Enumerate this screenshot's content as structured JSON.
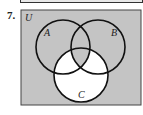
{
  "problem": {
    "number": "7."
  },
  "diagram": {
    "universe_label": "U",
    "sets": [
      {
        "label": "A",
        "cx": 63,
        "cy": 47,
        "r": 27
      },
      {
        "label": "B",
        "cx": 98,
        "cy": 47,
        "r": 27
      },
      {
        "label": "C",
        "cx": 81,
        "cy": 75,
        "r": 27
      }
    ],
    "shaded_color": "#c4c4c4",
    "unshaded_color": "#ffffff",
    "shading": "Everything shaded except C minus (A ∩ B ∩ C)"
  }
}
